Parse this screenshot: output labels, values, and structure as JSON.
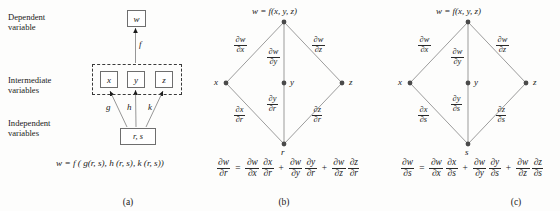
{
  "figure": {
    "panels": [
      {
        "id": "a",
        "caption": "(a)",
        "row_labels": [
          {
            "line1": "Dependent",
            "line2": "variable"
          },
          {
            "line1": "Intermediate",
            "line2": "variables"
          },
          {
            "line1": "Independent",
            "line2": "variables"
          }
        ],
        "boxes": {
          "w": "w",
          "x": "x",
          "y": "y",
          "z": "z",
          "rs": "r, s"
        },
        "arrow_labels": {
          "f": "f",
          "g": "g",
          "h": "h",
          "k": "k"
        },
        "equation": "w = f ( g(r, s), h (r, s), k (r, s))"
      },
      {
        "id": "b",
        "caption": "(b)",
        "nodes": {
          "top": "w = f(x, y, z)",
          "left": "x",
          "middle": "y",
          "right": "z",
          "bottom": "r"
        },
        "edges": {
          "upper_left": {
            "num": "∂w",
            "den": "∂x"
          },
          "upper_mid": {
            "num": "∂w",
            "den": "∂y"
          },
          "upper_right": {
            "num": "∂w",
            "den": "∂z"
          },
          "lower_left": {
            "num": "∂x",
            "den": "∂r"
          },
          "lower_mid": {
            "num": "∂y",
            "den": "∂r"
          },
          "lower_right": {
            "num": "∂z",
            "den": "∂r"
          }
        },
        "equation": {
          "lhs": {
            "num": "∂w",
            "den": "∂r"
          },
          "terms": [
            {
              "a": {
                "num": "∂w",
                "den": "∂x"
              },
              "b": {
                "num": "∂x",
                "den": "∂r"
              }
            },
            {
              "a": {
                "num": "∂w",
                "den": "∂y"
              },
              "b": {
                "num": "∂y",
                "den": "∂r"
              }
            },
            {
              "a": {
                "num": "∂w",
                "den": "∂z"
              },
              "b": {
                "num": "∂z",
                "den": "∂r"
              }
            }
          ],
          "equals": "=",
          "plus": "+"
        }
      },
      {
        "id": "c",
        "caption": "(c)",
        "nodes": {
          "top": "w = f(x, y, z)",
          "left": "x",
          "middle": "y",
          "right": "z",
          "bottom": "s"
        },
        "edges": {
          "upper_left": {
            "num": "∂w",
            "den": "∂x"
          },
          "upper_mid": {
            "num": "∂w",
            "den": "∂y"
          },
          "upper_right": {
            "num": "∂w",
            "den": "∂z"
          },
          "lower_left": {
            "num": "∂x",
            "den": "∂s"
          },
          "lower_mid": {
            "num": "∂y",
            "den": "∂s"
          },
          "lower_right": {
            "num": "∂z",
            "den": "∂s"
          }
        },
        "equation": {
          "lhs": {
            "num": "∂w",
            "den": "∂s"
          },
          "terms": [
            {
              "a": {
                "num": "∂w",
                "den": "∂x"
              },
              "b": {
                "num": "∂x",
                "den": "∂s"
              }
            },
            {
              "a": {
                "num": "∂w",
                "den": "∂y"
              },
              "b": {
                "num": "∂y",
                "den": "∂s"
              }
            },
            {
              "a": {
                "num": "∂w",
                "den": "∂z"
              },
              "b": {
                "num": "∂z",
                "den": "∂s"
              }
            }
          ],
          "equals": "=",
          "plus": "+"
        }
      }
    ],
    "colors": {
      "background": "#fdfdfc",
      "line": "#8a8a8a",
      "box_border": "#6e6e6e",
      "dashed_border": "#3a3a3a",
      "text": "#1a1a1a",
      "node_dot": "#4a4a4a"
    }
  }
}
